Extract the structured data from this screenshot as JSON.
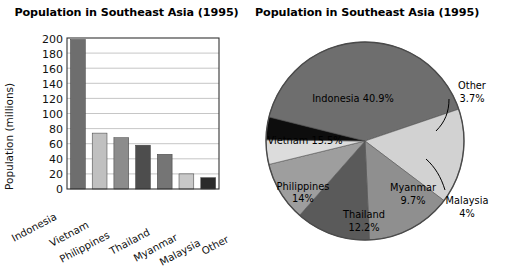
{
  "bar_panel": {
    "title": "Population in Southeast Asia (1995)",
    "y_axis_label": "Population (millions)",
    "ticks": [
      "200",
      "180",
      "160",
      "140",
      "120",
      "100",
      "80",
      "60",
      "40",
      "20",
      "0"
    ],
    "categories": [
      "Indonesia",
      "Vietnam",
      "Philippines",
      "Thailand",
      "Myanmar",
      "Malaysia",
      "Other"
    ]
  },
  "pie_panel": {
    "title": "Population in Southeast Asia (1995)",
    "labels": {
      "indonesia": "Indonesia 40.9%",
      "vietnam": "Vietnam 15.5%",
      "philippines_name": "Philippines",
      "philippines_pct": "14%",
      "thailand_name": "Thailand",
      "thailand_pct": "12.2%",
      "myanmar_name": "Myanmar",
      "myanmar_pct": "9.7%",
      "malaysia_name": "Malaysia",
      "malaysia_pct": "4%",
      "other_name": "Other",
      "other_pct": "3.7%"
    }
  },
  "chart_data": [
    {
      "type": "bar",
      "title": "Population in Southeast Asia (1995)",
      "xlabel": "",
      "ylabel": "Population (millions)",
      "categories": [
        "Indonesia",
        "Vietnam",
        "Philippines",
        "Thailand",
        "Myanmar",
        "Malaysia",
        "Other"
      ],
      "values": [
        198,
        74,
        68,
        58,
        46,
        20,
        15
      ],
      "ylim": [
        0,
        200
      ],
      "ytick_step": 20,
      "yticks": [
        0,
        20,
        40,
        60,
        80,
        100,
        120,
        140,
        160,
        180,
        200
      ],
      "grid": true,
      "legend": "none",
      "bar_colors": [
        "#6e6e6e",
        "#c0c0c0",
        "#8c8c8c",
        "#4d4d4d",
        "#757575",
        "#c8c8c8",
        "#2b2b2b"
      ]
    },
    {
      "type": "pie",
      "title": "Population in Southeast Asia (1995)",
      "categories": [
        "Indonesia",
        "Vietnam",
        "Philippines",
        "Thailand",
        "Myanmar",
        "Malaysia",
        "Other"
      ],
      "values": [
        40.9,
        15.5,
        14,
        12.2,
        9.7,
        4,
        3.7
      ],
      "unit": "%",
      "legend": "none",
      "labels_on_slices": true,
      "slice_colors": [
        "#6e6e6e",
        "#d2d2d2",
        "#8f8f8f",
        "#5a5a5a",
        "#9e9e9e",
        "#dcdcdc",
        "#0d0d0d"
      ],
      "leader_lines": [
        "Malaysia",
        "Other"
      ]
    }
  ],
  "colors": {
    "background": "#ffffff",
    "text": "#111111",
    "axis": "#333333",
    "grid": "#b8b8b8"
  }
}
